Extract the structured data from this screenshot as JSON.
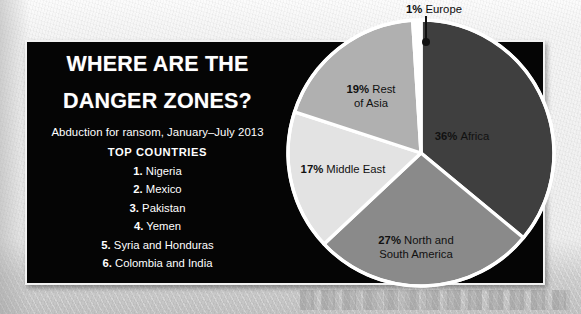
{
  "panel": {
    "title_line1": "WHERE ARE THE",
    "title_line2": "DANGER ZONES?",
    "subtitle": "Abduction for ransom, January–July 2013",
    "list_heading": "TOP COUNTRIES",
    "countries": [
      {
        "num": "1.",
        "name": "Nigeria"
      },
      {
        "num": "2.",
        "name": "Mexico"
      },
      {
        "num": "3.",
        "name": "Pakistan"
      },
      {
        "num": "4.",
        "name": "Yemen"
      },
      {
        "num": "5.",
        "name": "Syria and Honduras"
      },
      {
        "num": "6.",
        "name": "Colombia and India"
      }
    ]
  },
  "chart_data": {
    "type": "pie",
    "title": "WHERE ARE THE DANGER ZONES?",
    "subtitle": "Abduction for ransom, January–July 2013",
    "unit": "percent",
    "legend": "inside-slice-labels",
    "categories": [
      "Africa",
      "North and South America",
      "Middle East",
      "Rest of Asia",
      "Europe"
    ],
    "values": [
      36,
      27,
      17,
      19,
      1
    ],
    "colors": [
      "#3f3f3f",
      "#8a8a8a",
      "#e3e3e3",
      "#b0b0b0",
      "#ffffff"
    ],
    "slices": [
      {
        "pct": "36%",
        "name": "Africa",
        "value": 36,
        "color": "#3f3f3f",
        "label_x": 176,
        "label_y": 122,
        "anchor": "middle"
      },
      {
        "pct": "27%",
        "name": "North and",
        "value": 27,
        "color": "#8a8a8a",
        "label_x": 130,
        "label_y": 226,
        "anchor": "middle",
        "name_line2": "South America"
      },
      {
        "pct": "17%",
        "name": "Middle East",
        "value": 17,
        "color": "#e3e3e3",
        "label_x": 57,
        "label_y": 155,
        "anchor": "middle"
      },
      {
        "pct": "19%",
        "name": "Rest",
        "value": 19,
        "color": "#b0b0b0",
        "label_x": 85,
        "label_y": 75,
        "anchor": "middle",
        "name_line2": "of Asia"
      },
      {
        "pct": "1%",
        "name": "Europe",
        "value": 1,
        "color": "#ffffff",
        "callout": true,
        "label_x": 148,
        "label_y": -5,
        "anchor": "middle"
      }
    ],
    "separator_color": "#ffffff",
    "outer_ring_color": "#ffffff",
    "callout_line_color": "#111111"
  }
}
